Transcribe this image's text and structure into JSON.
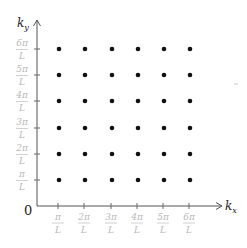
{
  "diagram": {
    "x_axis": {
      "label": "k",
      "subscript": "x"
    },
    "y_axis": {
      "label": "k",
      "subscript": "y"
    },
    "origin_label": "0",
    "tick_labels": [
      {
        "num": "π",
        "den": "L"
      },
      {
        "num": "2π",
        "den": "L"
      },
      {
        "num": "3π",
        "den": "L"
      },
      {
        "num": "4π",
        "den": "L"
      },
      {
        "num": "5π",
        "den": "L"
      },
      {
        "num": "6π",
        "den": "L"
      }
    ],
    "grid": {
      "rows": 6,
      "cols": 6
    },
    "colors": {
      "axis": "#555555",
      "dot": "#111111",
      "tick_label": "#b8b8b8"
    }
  }
}
